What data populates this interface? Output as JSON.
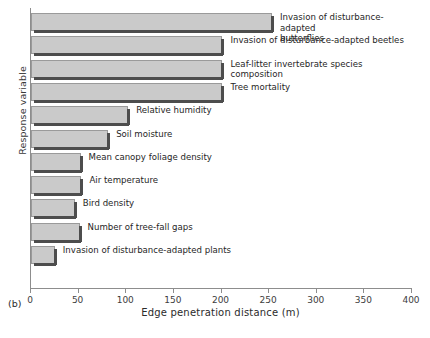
{
  "caption": "(b)",
  "axes": {
    "ylabel": "Response variable",
    "xlabel": "Edge penetration distance (m)",
    "xticks": [
      "0",
      "50",
      "100",
      "150",
      "200",
      "250",
      "300",
      "350",
      "400"
    ]
  },
  "colors": {
    "bar_fill": "#cacaca",
    "bar_edge": "#9a9a9a",
    "bar_shadow": "#4d4d4d",
    "axis": "#8d8d8d",
    "text": "#262626"
  },
  "chart_data": {
    "type": "bar",
    "orientation": "horizontal",
    "title": "",
    "xlabel": "Edge penetration distance (m)",
    "ylabel": "Response variable",
    "xlim": [
      0,
      400
    ],
    "grid": false,
    "legend": null,
    "categories": [
      "Invasion of disturbance-adapted\nbutterflies",
      "Invasion of disturbance-adapted beetles",
      "Leaf-litter invertebrate species composition",
      "Tree mortality",
      "Relative humidity",
      "Soil moisture",
      "Mean canopy foliage density",
      "Air temperature",
      "Bird density",
      "Number of tree-fall gaps",
      "Invasion of disturbance-adapted plants"
    ],
    "values": [
      253,
      201,
      201,
      201,
      102,
      81,
      52,
      53,
      46,
      51,
      25
    ],
    "xtick_values": [
      0,
      50,
      100,
      150,
      200,
      250,
      300,
      350,
      400
    ]
  }
}
